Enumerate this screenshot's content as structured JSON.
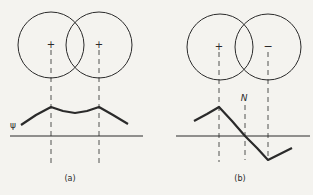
{
  "figure": {
    "colors": {
      "ink": "#2a2a2a",
      "background": "#f4f3ef"
    },
    "panels": [
      {
        "id": "a",
        "caption": "(a)",
        "axis_label": "ψ",
        "orbitals": [
          {
            "sign": "+",
            "cx": 51,
            "cy": 45,
            "r": 33
          },
          {
            "sign": "+",
            "cx": 99,
            "cy": 45,
            "r": 33
          }
        ],
        "curve_points": "21,125 36,115 51,107 63,111 75,113 87,111 99,107 113,115 128,124",
        "node_label": ""
      },
      {
        "id": "b",
        "caption": "(b)",
        "axis_label": "",
        "orbitals": [
          {
            "sign": "+",
            "cx": 220,
            "cy": 47,
            "r": 33
          },
          {
            "sign": "−",
            "cx": 268,
            "cy": 47,
            "r": 33
          }
        ],
        "curve_points": "194,121 207,114 219,107 232,121 245,136 257,148 268,160 280,154 292,148",
        "node_label": "N"
      }
    ]
  }
}
